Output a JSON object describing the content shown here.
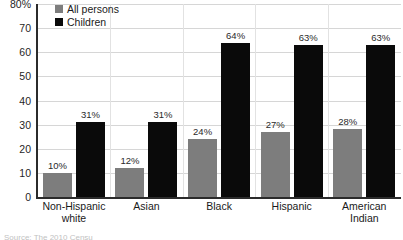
{
  "chart_data": {
    "type": "bar",
    "title": "",
    "subtitle": "",
    "xlabel": "",
    "ylabel": "",
    "ylim": [
      0,
      80
    ],
    "ytick_values": [
      0,
      10,
      20,
      30,
      40,
      50,
      60,
      70,
      80
    ],
    "ytick_labels": [
      "0",
      "10",
      "20",
      "30",
      "40",
      "50",
      "60",
      "70",
      "80%"
    ],
    "grid": true,
    "legend_position": "top-left",
    "categories": [
      "Non-Hispanic white",
      "Asian",
      "Black",
      "Hispanic",
      "American Indian"
    ],
    "category_label_lines": [
      [
        "Non-Hispanic",
        "white"
      ],
      [
        "Asian"
      ],
      [
        "Black"
      ],
      [
        "Hispanic"
      ],
      [
        "American",
        "Indian"
      ]
    ],
    "series": [
      {
        "name": "All persons",
        "color": "#7d7d7d",
        "values": [
          10,
          12,
          24,
          27,
          28
        ],
        "value_labels": [
          "10%",
          "12%",
          "24%",
          "27%",
          "28%"
        ]
      },
      {
        "name": "Children",
        "color": "#0a0a0a",
        "values": [
          31,
          31,
          64,
          63,
          63
        ],
        "value_labels": [
          "31%",
          "31%",
          "64%",
          "63%",
          "63%"
        ]
      }
    ]
  },
  "legend": {
    "items": [
      {
        "label": "All persons",
        "color": "#7d7d7d"
      },
      {
        "label": "Children",
        "color": "#0a0a0a"
      }
    ]
  },
  "footer": {
    "note": "Source: The 2010 Censu"
  }
}
